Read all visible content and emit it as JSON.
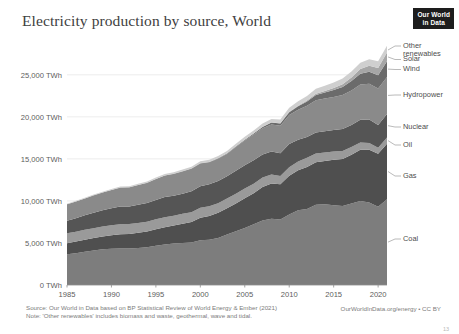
{
  "header": {
    "title": "Electricity production by source, World",
    "logo_line1": "Our World",
    "logo_line2": "in Data"
  },
  "footer": {
    "source": "Source: Our World in Data based on BP Statistical Review of World Energy & Ember (2021)",
    "note": "Note: 'Other renewables' includes biomass and waste, geothermal, wave and tidal.",
    "attribution": "OurWorldInData.org/energy • CC BY",
    "page_number": "13"
  },
  "chart_data": {
    "type": "area",
    "stacked": true,
    "title": "Electricity production by source, World",
    "xlabel": "",
    "ylabel": "",
    "ylim": [
      0,
      27000
    ],
    "xlim": [
      1985,
      2021
    ],
    "grid": true,
    "legend_position": "right-outside",
    "y_unit": "TWh",
    "y_ticks": [
      0,
      5000,
      10000,
      15000,
      20000,
      25000
    ],
    "y_tick_labels": [
      "0 TWh",
      "5,000 TWh",
      "10,000 TWh",
      "15,000 TWh",
      "20,000 TWh",
      "25,000 TWh"
    ],
    "x_ticks": [
      1985,
      1990,
      1995,
      2000,
      2005,
      2010,
      2015,
      2020
    ],
    "x_tick_labels": [
      "1985",
      "1990",
      "1995",
      "2000",
      "2005",
      "2010",
      "2015",
      "2020"
    ],
    "x": [
      1985,
      1986,
      1987,
      1988,
      1989,
      1990,
      1991,
      1992,
      1993,
      1994,
      1995,
      1996,
      1997,
      1998,
      1999,
      2000,
      2001,
      2002,
      2003,
      2004,
      2005,
      2006,
      2007,
      2008,
      2009,
      2010,
      2011,
      2012,
      2013,
      2014,
      2015,
      2016,
      2017,
      2018,
      2019,
      2020,
      2021
    ],
    "series": [
      {
        "name": "Coal",
        "color": "#7d7d7d",
        "values": [
          3650,
          3790,
          3960,
          4110,
          4240,
          4310,
          4340,
          4330,
          4400,
          4480,
          4660,
          4830,
          4930,
          5000,
          5050,
          5310,
          5390,
          5590,
          6000,
          6380,
          6790,
          7220,
          7660,
          7880,
          7800,
          8400,
          8900,
          9050,
          9550,
          9600,
          9500,
          9400,
          9700,
          10000,
          9800,
          9300,
          10200
        ]
      },
      {
        "name": "Gas",
        "color": "#4f4f4f",
        "values": [
          1320,
          1370,
          1430,
          1470,
          1540,
          1620,
          1700,
          1740,
          1800,
          1870,
          1980,
          2050,
          2140,
          2290,
          2440,
          2690,
          2810,
          2990,
          3120,
          3300,
          3530,
          3700,
          4000,
          4200,
          4180,
          4600,
          4750,
          5000,
          5050,
          5150,
          5400,
          5600,
          5800,
          6100,
          6300,
          6300,
          6600
        ]
      },
      {
        "name": "Oil",
        "color": "#9a9a9a",
        "values": [
          1180,
          1180,
          1170,
          1160,
          1180,
          1190,
          1200,
          1180,
          1180,
          1170,
          1170,
          1180,
          1180,
          1170,
          1160,
          1180,
          1170,
          1150,
          1180,
          1170,
          1160,
          1130,
          1120,
          1060,
          990,
          1010,
          1050,
          1100,
          1050,
          1000,
          980,
          950,
          900,
          850,
          800,
          720,
          750
        ]
      },
      {
        "name": "Nuclear",
        "color": "#555555",
        "values": [
          1490,
          1600,
          1740,
          1850,
          1940,
          2000,
          2090,
          2100,
          2170,
          2220,
          2300,
          2400,
          2360,
          2400,
          2510,
          2580,
          2610,
          2650,
          2630,
          2730,
          2760,
          2790,
          2740,
          2730,
          2690,
          2760,
          2580,
          2460,
          2480,
          2530,
          2570,
          2610,
          2640,
          2700,
          2790,
          2700,
          2800
        ]
      },
      {
        "name": "Hydropower",
        "color": "#8a8a8a",
        "values": [
          1950,
          1990,
          2000,
          2070,
          2090,
          2180,
          2250,
          2260,
          2340,
          2400,
          2500,
          2560,
          2600,
          2650,
          2670,
          2700,
          2620,
          2650,
          2660,
          2820,
          2940,
          3050,
          3110,
          3230,
          3270,
          3450,
          3550,
          3700,
          3830,
          3890,
          3900,
          4030,
          4080,
          4200,
          4260,
          4350,
          4400
        ]
      },
      {
        "name": "Wind",
        "color": "#6b6b6b",
        "values": [
          1,
          2,
          2,
          3,
          3,
          4,
          5,
          6,
          7,
          9,
          11,
          12,
          15,
          20,
          25,
          31,
          40,
          52,
          64,
          85,
          104,
          133,
          171,
          221,
          276,
          342,
          434,
          528,
          646,
          717,
          832,
          958,
          1130,
          1270,
          1420,
          1590,
          1860
        ]
      },
      {
        "name": "Solar",
        "color": "#a6a6a6",
        "values": [
          0,
          0,
          0,
          0,
          0,
          0,
          0,
          0,
          0,
          1,
          1,
          1,
          1,
          1,
          1,
          1,
          2,
          2,
          3,
          4,
          5,
          6,
          7,
          12,
          20,
          32,
          64,
          98,
          135,
          190,
          253,
          328,
          445,
          570,
          700,
          850,
          1030
        ]
      },
      {
        "name": "Other renewables",
        "color": "#cfcfcf",
        "values": [
          70,
          75,
          82,
          90,
          98,
          107,
          117,
          126,
          136,
          147,
          160,
          172,
          185,
          198,
          212,
          228,
          245,
          263,
          282,
          305,
          330,
          356,
          388,
          420,
          450,
          480,
          520,
          556,
          590,
          620,
          650,
          680,
          710,
          740,
          770,
          790,
          820
        ]
      }
    ],
    "legend": [
      {
        "label": "Other\nrenewables",
        "key": "other-renewables"
      },
      {
        "label": "Solar",
        "key": "solar"
      },
      {
        "label": "Wind",
        "key": "wind"
      },
      {
        "label": "Hydropower",
        "key": "hydropower"
      },
      {
        "label": "Nuclear",
        "key": "nuclear"
      },
      {
        "label": "Oil",
        "key": "oil"
      },
      {
        "label": "Gas",
        "key": "gas"
      },
      {
        "label": "Coal",
        "key": "coal"
      }
    ]
  }
}
